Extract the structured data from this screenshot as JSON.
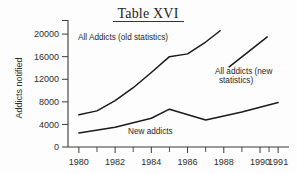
{
  "chart_data": {
    "type": "line",
    "title": "Table XVI",
    "xlabel": "",
    "ylabel": "Addicts notified",
    "xlim": [
      1979.4,
      1991.6
    ],
    "ylim": [
      0,
      22500
    ],
    "grid": false,
    "legend_position": "inline-annotations",
    "y_ticks": [
      0,
      4000,
      8000,
      12000,
      16000,
      20000
    ],
    "y_tick_labels": [
      "0",
      "4000",
      "8000",
      "12000",
      "16000",
      "20000"
    ],
    "x_ticks": [
      1980,
      1982,
      1984,
      1986,
      1988,
      1990,
      1991
    ],
    "x_tick_labels": [
      "1980",
      "1982",
      "1984",
      "1986",
      "1988",
      "1990",
      "1991"
    ],
    "x_minor_ticks": [
      1981,
      1983,
      1985,
      1987,
      1989,
      1990.5
    ],
    "series": [
      {
        "name": "All Addicts (old statistics)",
        "x": [
          1980,
          1981,
          1982,
          1983,
          1984,
          1985,
          1986,
          1987,
          1987.8
        ],
        "values": [
          5700,
          6400,
          8200,
          10500,
          13200,
          16000,
          16500,
          18600,
          20600
        ]
      },
      {
        "name": "All addicts (new statistics)",
        "x": [
          1988.3,
          1990.4
        ],
        "values": [
          14200,
          19500
        ]
      },
      {
        "name": "New addicts",
        "x": [
          1980,
          1982,
          1984,
          1985,
          1987,
          1989,
          1991
        ],
        "values": [
          2500,
          3500,
          5100,
          6700,
          4800,
          6200,
          7900
        ]
      }
    ],
    "annotations": [
      {
        "text": "All Addicts (old statistics)",
        "series": "All Addicts (old statistics)"
      },
      {
        "text_line1": "All addicts (new",
        "text_line2": "statistics)",
        "series": "All addicts (new statistics)"
      },
      {
        "text": "New addicts",
        "series": "New addicts"
      }
    ]
  },
  "colors": {
    "ink": "#1a1a1a",
    "axis": "#3a3a3a",
    "background": "#fdfdfd"
  }
}
